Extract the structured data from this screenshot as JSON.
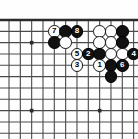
{
  "diagram": {
    "type": "go-board-diagram",
    "title": "",
    "board": {
      "visible_cols": 12,
      "visible_rows": 11,
      "cell_px": 11.33,
      "origin_x": 9,
      "origin_y": 20,
      "line_color": "#4a4a4a",
      "edge_color": "#2b2b2b",
      "background": "#fefefe",
      "edges": {
        "top": true,
        "left": false,
        "right": false,
        "bottom": false
      }
    },
    "star_points": [
      {
        "col": 2,
        "row": 2
      },
      {
        "col": 2,
        "row": 8
      },
      {
        "col": 8,
        "row": 8
      }
    ],
    "stones": [
      {
        "col": 4,
        "row": 1,
        "color": "white",
        "label": "7"
      },
      {
        "col": 5,
        "row": 1,
        "color": "black",
        "label": ""
      },
      {
        "col": 6,
        "row": 1,
        "color": "black",
        "label": "8"
      },
      {
        "col": 8,
        "row": 1,
        "color": "white",
        "label": ""
      },
      {
        "col": 9,
        "row": 1,
        "color": "white",
        "label": ""
      },
      {
        "col": 10,
        "row": 1,
        "color": "black",
        "label": ""
      },
      {
        "col": 4,
        "row": 2,
        "color": "black",
        "label": ""
      },
      {
        "col": 5,
        "row": 2,
        "color": "white",
        "label": ""
      },
      {
        "col": 8,
        "row": 2,
        "color": "white",
        "label": ""
      },
      {
        "col": 9,
        "row": 2,
        "color": "white",
        "label": ""
      },
      {
        "col": 10,
        "row": 2,
        "color": "black",
        "label": ""
      },
      {
        "col": 6,
        "row": 3,
        "color": "white",
        "label": "5"
      },
      {
        "col": 7,
        "row": 3,
        "color": "black",
        "label": "2"
      },
      {
        "col": 8,
        "row": 3,
        "color": "black",
        "label": ""
      },
      {
        "col": 9,
        "row": 3,
        "color": "white",
        "label": ""
      },
      {
        "col": 10,
        "row": 3,
        "color": "white",
        "label": ""
      },
      {
        "col": 11,
        "row": 3,
        "color": "black",
        "label": "4"
      },
      {
        "col": 6,
        "row": 4,
        "color": "white",
        "label": "3"
      },
      {
        "col": 8,
        "row": 4,
        "color": "white",
        "label": "1"
      },
      {
        "col": 9,
        "row": 4,
        "color": "black",
        "label": ""
      },
      {
        "col": 10,
        "row": 4,
        "color": "black",
        "label": "6"
      },
      {
        "col": 9,
        "row": 5,
        "color": "black",
        "label": ""
      }
    ],
    "move_sequence": [
      "1",
      "2",
      "3",
      "4",
      "5",
      "6",
      "7",
      "8"
    ]
  }
}
